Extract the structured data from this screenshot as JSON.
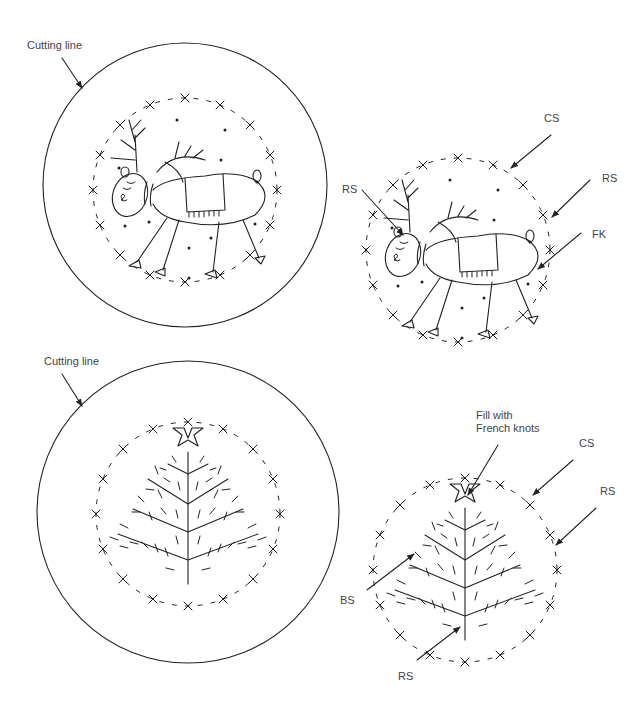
{
  "panels": {
    "reindeer_template": {
      "cut_label": "Cutting line"
    },
    "reindeer_guide": {
      "labels": {
        "cs": "CS",
        "rs_top": "RS",
        "rs_left": "RS",
        "fk": "FK"
      }
    },
    "tree_template": {
      "cut_label": "Cutting line"
    },
    "tree_guide": {
      "labels": {
        "fill": "Fill with",
        "fill2": "French knots",
        "cs": "CS",
        "rs_right": "RS",
        "bs": "BS",
        "rs_bottom": "RS"
      }
    }
  },
  "legend": {
    "CS": "cross stitch",
    "RS": "running stitch",
    "FK": "French knot",
    "BS": "back stitch"
  },
  "colors": {
    "line": "#222222",
    "text": "#444444",
    "background": "#ffffff"
  }
}
